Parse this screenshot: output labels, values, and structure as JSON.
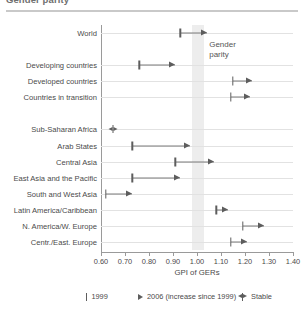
{
  "figure": {
    "title_cropped": "Gender parity",
    "colors": {
      "marker": "#5d5d5d",
      "connector": "#7d7d7d",
      "gridline": "#e2e2e2",
      "axis": "#9a9a9a",
      "parity_band": "#ededed",
      "background": "#ffffff"
    }
  },
  "chart_data": {
    "type": "scatter",
    "title": "Gender parity",
    "xlabel": "GPI of GERs",
    "ylabel": "",
    "xlim": [
      0.6,
      1.4
    ],
    "xticks": [
      "0.60",
      "0.70",
      "0.80",
      "0.90",
      "1.00",
      "1.10",
      "1.20",
      "1.30",
      "1.40"
    ],
    "xtick_values": [
      0.6,
      0.7,
      0.8,
      0.9,
      1.0,
      1.1,
      1.2,
      1.3,
      1.4
    ],
    "grid": true,
    "legend_position": "bottom",
    "annotations": [
      {
        "name": "gender-parity-band",
        "label": "Gender\nparity",
        "label_line1": "Gender",
        "label_line2": "parity",
        "x_start": 0.98,
        "x_end": 1.03
      }
    ],
    "categories": [
      "World",
      "",
      "Developing countries",
      "Developed countries",
      "Countries in transition",
      "",
      "Sub-Saharan Africa",
      "Arab States",
      "Central Asia",
      "East Asia and the Pacific",
      "South and West Asia",
      "Latin America/Caribbean",
      "N. America/W. Europe",
      "Centr./East. Europe"
    ],
    "series": [
      {
        "name": "1999",
        "marker": "bar"
      },
      {
        "name": "2006 (increase since 1999)",
        "marker": "arrow"
      },
      {
        "name": "Stable",
        "marker": "stable"
      }
    ],
    "points": [
      {
        "category": "World",
        "v1999": 0.93,
        "v2006": 1.04,
        "stable": false
      },
      {
        "category": "Developing countries",
        "v1999": 0.76,
        "v2006": 0.91,
        "stable": false
      },
      {
        "category": "Developed countries",
        "v1999": 1.15,
        "v2006": 1.23,
        "stable": false
      },
      {
        "category": "Countries in transition",
        "v1999": 1.14,
        "v2006": 1.22,
        "stable": false
      },
      {
        "category": "Sub-Saharan Africa",
        "v1999": 0.65,
        "v2006": 0.65,
        "stable": true
      },
      {
        "category": "Arab States",
        "v1999": 0.73,
        "v2006": 0.97,
        "stable": false
      },
      {
        "category": "Central Asia",
        "v1999": 0.91,
        "v2006": 1.07,
        "stable": false
      },
      {
        "category": "East Asia and the Pacific",
        "v1999": 0.73,
        "v2006": 0.93,
        "stable": false
      },
      {
        "category": "South and West Asia",
        "v1999": 0.62,
        "v2006": 0.73,
        "stable": false
      },
      {
        "category": "Latin America/Caribbean",
        "v1999": 1.08,
        "v2006": 1.13,
        "stable": false
      },
      {
        "category": "N. America/W. Europe",
        "v1999": 1.19,
        "v2006": 1.28,
        "stable": false
      },
      {
        "category": "Centr./East. Europe",
        "v1999": 1.14,
        "v2006": 1.21,
        "stable": false
      }
    ]
  },
  "legend": {
    "items": [
      {
        "label": "1999",
        "marker": "bar"
      },
      {
        "label": "2006 (increase since 1999)",
        "marker": "arrow"
      },
      {
        "label": "Stable",
        "marker": "stable"
      }
    ]
  }
}
